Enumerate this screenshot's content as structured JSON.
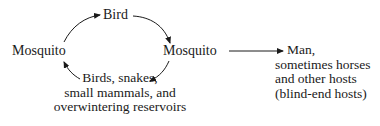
{
  "diagram": {
    "type": "transmission-cycle",
    "nodes": {
      "bird": "Bird",
      "mosquito_left": "Mosquito",
      "mosquito_right": "Mosquito",
      "reservoirs": {
        "lines": [
          "Birds, snakes,",
          "small mammals, and",
          "overwintering reservoirs"
        ]
      },
      "dead_end": {
        "lines": [
          "Man,",
          "sometimes horses",
          "and other hosts",
          "(blind-end hosts)"
        ]
      }
    },
    "edges": [
      {
        "from": "mosquito_left",
        "to": "bird"
      },
      {
        "from": "bird",
        "to": "mosquito_right"
      },
      {
        "from": "mosquito_right",
        "to": "reservoirs"
      },
      {
        "from": "reservoirs",
        "to": "mosquito_left"
      },
      {
        "from": "mosquito_right",
        "to": "dead_end"
      }
    ],
    "colors": {
      "ink": "#1a1a1a",
      "background": "#ffffff"
    }
  }
}
